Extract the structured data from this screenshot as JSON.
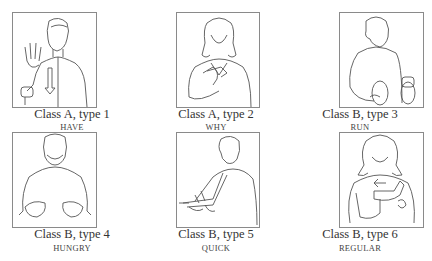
{
  "figure": {
    "panels": [
      {
        "class_label": "Class A, type 1",
        "sign": "HAVE"
      },
      {
        "class_label": "Class A, type 2",
        "sign": "WHY"
      },
      {
        "class_label": "Class B, type 3",
        "sign": "RUN"
      },
      {
        "class_label": "Class B, type 4",
        "sign": "HUNGRY"
      },
      {
        "class_label": "Class B, type 5",
        "sign": "QUICK"
      },
      {
        "class_label": "Class B, type 6",
        "sign": "REGULAR"
      }
    ],
    "colors": {
      "line": "#555555",
      "frame": "#8a8a8a",
      "background": "#ffffff"
    }
  }
}
